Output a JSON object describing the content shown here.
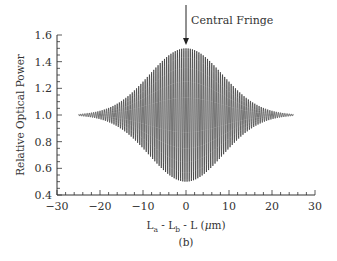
{
  "chart_data": {
    "type": "line",
    "title": "",
    "subtitle": "(b)",
    "xlabel": "L_a - L_b - L (μm)",
    "xlabel_parts": {
      "L1": "L",
      "sub1": "a",
      "sep1": " - ",
      "L2": "L",
      "sub2": "b",
      "rest": " - L (",
      "mu": "μ",
      "unit": "m)"
    },
    "ylabel": "Relative Optical Power",
    "xlim": [
      -30,
      30
    ],
    "ylim": [
      0.4,
      1.6
    ],
    "x_ticks": [
      -30,
      -20,
      -10,
      0,
      10,
      20,
      30
    ],
    "x_tick_labels": [
      "−30",
      "−20",
      "−10",
      "0",
      "10",
      "20",
      "30"
    ],
    "y_ticks": [
      0.4,
      0.6,
      0.8,
      1.0,
      1.2,
      1.4,
      1.6
    ],
    "y_tick_labels": [
      "0.4",
      "0.6",
      "0.8",
      "1.0",
      "1.2",
      "1.4",
      "1.6"
    ],
    "x_minor_step": 2,
    "y_minor_step": 0.05,
    "grid": false,
    "legend": null,
    "annotations": [
      {
        "text": "Central Fringe",
        "x": 0,
        "y": 1.5,
        "arrow": "down"
      }
    ],
    "series": [
      {
        "name": "Interference signal (white-light fringes)",
        "description": "Gaussian-enveloped cosine fringes around mean 1.0; envelope peaks at ±0.5 at x=0, decays to ~0 by ±25 μm",
        "x_range": [
          -25,
          25
        ],
        "mean": 1.0,
        "peak_amplitude": 0.5,
        "envelope_sigma_um": 8.5,
        "fringe_period_um": 0.5,
        "key_points": [
          {
            "x": -25,
            "ymax": 1.0,
            "ymin": 1.0
          },
          {
            "x": -20,
            "ymax": 1.03,
            "ymin": 0.97
          },
          {
            "x": -15,
            "ymax": 1.1,
            "ymin": 0.9
          },
          {
            "x": -10,
            "ymax": 1.25,
            "ymin": 0.75
          },
          {
            "x": -5,
            "ymax": 1.42,
            "ymin": 0.58
          },
          {
            "x": 0,
            "ymax": 1.5,
            "ymin": 0.5
          },
          {
            "x": 5,
            "ymax": 1.42,
            "ymin": 0.58
          },
          {
            "x": 10,
            "ymax": 1.25,
            "ymin": 0.75
          },
          {
            "x": 15,
            "ymax": 1.1,
            "ymin": 0.9
          },
          {
            "x": 20,
            "ymax": 1.03,
            "ymin": 0.97
          },
          {
            "x": 25,
            "ymax": 0.99,
            "ymin": 0.99
          }
        ]
      }
    ],
    "colors": {
      "line": "#1a1a1a",
      "axis": "#333333",
      "text": "#333333"
    }
  }
}
